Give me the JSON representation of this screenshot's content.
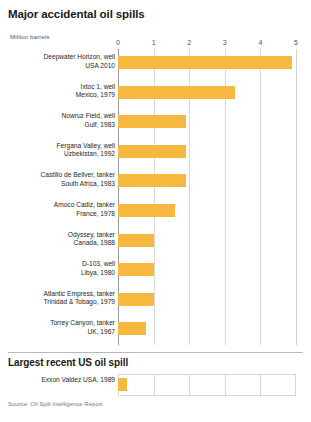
{
  "chart_data": {
    "type": "bar",
    "orientation": "horizontal",
    "title": "Major accidental oil spills",
    "subtitle": "",
    "xlabel": "Million barrels",
    "ylabel": "",
    "xlim": [
      0,
      5
    ],
    "xticks": [
      0,
      1,
      2,
      3,
      4,
      5
    ],
    "xtick_labels": [
      "0",
      "1",
      "2",
      "3",
      "4",
      "5"
    ],
    "grid": true,
    "legend": "none",
    "bar_color": "#F7B840",
    "categories": [
      "Deepwater Horizon, well",
      "Ixtoc 1, well",
      "Nowruz Field, well",
      "Fergana Valley, well",
      "Castillo de Bellver, tanker",
      "Amoco Cadiz, tanker",
      "Odyssey, tanker",
      "D-103, well",
      "Atlantic Empress, tanker",
      "Torrey Canyon, tanker"
    ],
    "category_sublabels": [
      "USA 2010",
      "Mexico, 1979",
      "Gulf, 1983",
      "Uzbekistan, 1992",
      "South Africa, 1983",
      "France, 1978",
      "Canada, 1988",
      "Libya, 1980",
      "Trinidad & Tobago, 1979",
      "UK, 1967"
    ],
    "values": [
      4.9,
      3.3,
      1.9,
      1.9,
      1.9,
      1.6,
      1.0,
      1.0,
      1.0,
      0.8
    ],
    "annotation": "Source: Oil Spill Intelligence Report"
  },
  "secondary_chart": {
    "type": "bar",
    "orientation": "horizontal",
    "title": "Largest recent US oil spill",
    "xlim": [
      0,
      5
    ],
    "grid": true,
    "bar_color": "#F7B840",
    "categories": [
      "Exxon Valdez"
    ],
    "category_sublabels": [
      "USA, 1989"
    ],
    "values": [
      0.26
    ]
  },
  "rows": [
    {
      "name": "Deepwater Horizon, well",
      "sub": "USA 2010",
      "value": 4.9
    },
    {
      "name": "Ixtoc 1, well",
      "sub": "Mexico, 1979",
      "value": 3.3
    },
    {
      "name": "Nowruz Field, well",
      "sub": "Gulf, 1983",
      "value": 1.9
    },
    {
      "name": "Fergana Valley, well",
      "sub": "Uzbekistan, 1992",
      "value": 1.9
    },
    {
      "name": "Castillo de Bellver, tanker",
      "sub": "South Africa, 1983",
      "value": 1.9
    },
    {
      "name": "Amoco Cadiz, tanker",
      "sub": "France, 1978",
      "value": 1.6
    },
    {
      "name": "Odyssey, tanker",
      "sub": "Canada, 1988",
      "value": 1.0
    },
    {
      "name": "D-103, well",
      "sub": "Libya, 1980",
      "value": 1.0
    },
    {
      "name": "Atlantic Empress, tanker",
      "sub": "Trinidad & Tobago, 1979",
      "value": 1.0
    },
    {
      "name": "Torrey Canyon, tanker",
      "sub": "UK, 1967",
      "value": 0.8
    }
  ],
  "bottom_row": {
    "name": "Exxon Valdez",
    "sub": "USA, 1989",
    "value": 0.26
  },
  "ticks": [
    "0",
    "1",
    "2",
    "3",
    "4",
    "5"
  ],
  "source": "Source: Oil Spill Intelligence Report"
}
